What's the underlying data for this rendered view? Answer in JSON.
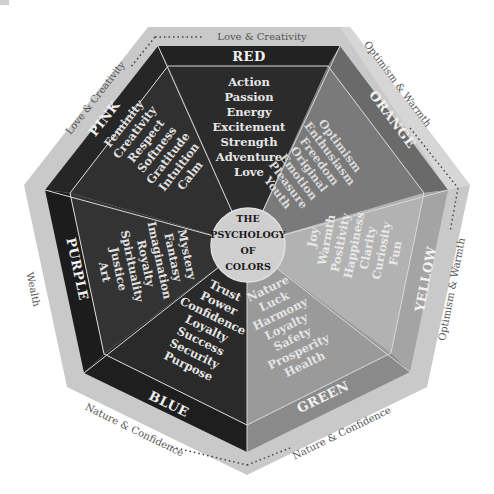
{
  "title": {
    "lines": [
      "THE",
      "PSYCHOLOGY",
      "OF",
      "COLORS"
    ]
  },
  "colors": {
    "outer_band": "#c9c9c9",
    "divider": "#d8d8d8",
    "center_circle": "#cfcfcf"
  },
  "segments": [
    {
      "name": "RED",
      "label": "RED",
      "band_fill": "#222222",
      "wedge_fill": "#2b2b2b",
      "text_fill": "#e6e6e6",
      "traits": [
        "Action",
        "Passion",
        "Energy",
        "Excitement",
        "Strength",
        "Adventure",
        "Love"
      ]
    },
    {
      "name": "ORANGE",
      "label": "ORANGE",
      "band_fill": "#6a6a6a",
      "wedge_fill": "#7a7a7a",
      "text_fill": "#d9d9d9",
      "traits": [
        "Optimism",
        "Enthusiasm",
        "Freedom",
        "Original",
        "Emotion",
        "Pleasure",
        "Youth"
      ]
    },
    {
      "name": "YELLOW",
      "label": "YELLOW",
      "band_fill": "#a4a4a4",
      "wedge_fill": "#b2b2b2",
      "text_fill": "#e8e8e8",
      "traits": [
        "Joy",
        "Warmth",
        "Positivity",
        "Happiness",
        "Clarity",
        "Curiosity",
        "Fun"
      ]
    },
    {
      "name": "GREEN",
      "label": "GREEN",
      "band_fill": "#8a8a8a",
      "wedge_fill": "#9a9a9a",
      "text_fill": "#e4e4e4",
      "traits": [
        "Nature",
        "Luck",
        "Harmony",
        "Loyalty",
        "Safety",
        "Prosperity",
        "Health"
      ]
    },
    {
      "name": "BLUE",
      "label": "BLUE",
      "band_fill": "#1e1e1e",
      "wedge_fill": "#2a2a2a",
      "text_fill": "#e6e6e6",
      "traits": [
        "Trust",
        "Power",
        "Confidence",
        "Loyalty",
        "Success",
        "Security",
        "Purpose"
      ]
    },
    {
      "name": "PURPLE",
      "label": "PURPLE",
      "band_fill": "#1c1c1c",
      "wedge_fill": "#333333",
      "text_fill": "#e0e0e0",
      "traits": [
        "Mystery",
        "Fantasy",
        "Imagination",
        "Royalty",
        "Spirituality",
        "Justice",
        "Art"
      ]
    },
    {
      "name": "PINK",
      "label": "PINK",
      "band_fill": "#262626",
      "wedge_fill": "#303030",
      "text_fill": "#e0e0e0",
      "traits": [
        "Feminity",
        "Creativity",
        "Respect",
        "Softness",
        "Gratitude",
        "Intuition",
        "Calm"
      ]
    }
  ],
  "themes": [
    {
      "position": "top",
      "text": "Love & Creativity"
    },
    {
      "position": "upper-left",
      "text": "Love & Creativity"
    },
    {
      "position": "upper-right",
      "text": "Optimism & Warmth"
    },
    {
      "position": "right",
      "text": "Optimism & Warmth"
    },
    {
      "position": "left",
      "text": "Wealth"
    },
    {
      "position": "lower-left",
      "text": "Nature & Confidence"
    },
    {
      "position": "lower-right",
      "text": "Nature & Confidence"
    }
  ]
}
